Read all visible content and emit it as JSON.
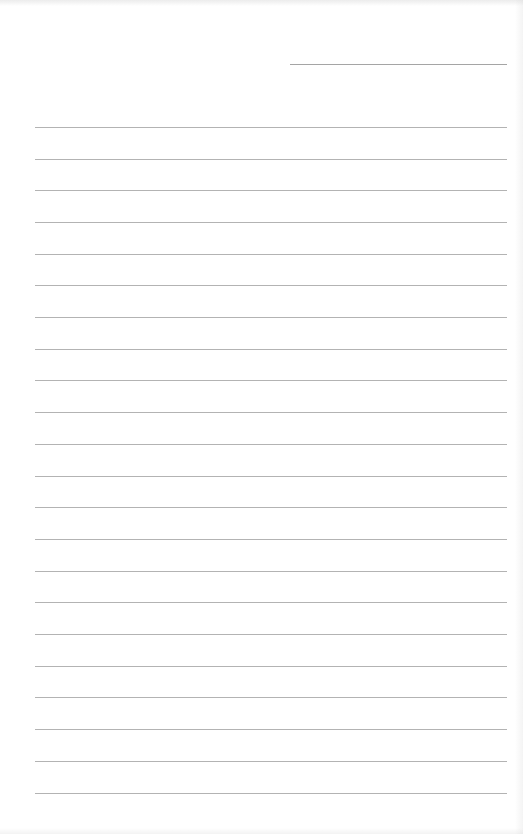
{
  "document": {
    "type": "lined-paper",
    "background_color": "#ffffff",
    "line_color": "#9a9a9a",
    "header_line": {
      "x1": 290,
      "x2": 507,
      "y": 64
    },
    "ruled_lines": {
      "x1": 35,
      "x2": 507,
      "count": 22,
      "y_positions": [
        127,
        159,
        190,
        222,
        254,
        285,
        317,
        349,
        380,
        412,
        444,
        476,
        507,
        539,
        571,
        602,
        634,
        666,
        697,
        729,
        761,
        793
      ]
    },
    "text_content": []
  }
}
